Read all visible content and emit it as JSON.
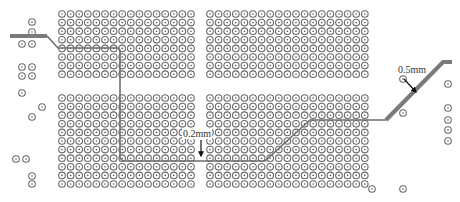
{
  "diagram": {
    "title": "",
    "colors": {
      "via_ring": "#6b6b6b",
      "via_dot": "#555555",
      "thick_trace": "#7a7a7a",
      "thin_trace": "#6e6e6e",
      "arrow": "#111111",
      "background": "#ffffff"
    },
    "via_grid": {
      "pitch": 8.6,
      "radius": 3.3,
      "blocks": [
        {
          "name": "left-upper",
          "x0": 62,
          "x1": 195,
          "y0": 14,
          "y1": 78
        },
        {
          "name": "right-upper",
          "x0": 210,
          "x1": 365,
          "y0": 14,
          "y1": 78
        },
        {
          "name": "left-lower",
          "x0": 62,
          "x1": 195,
          "y0": 98,
          "y1": 188
        },
        {
          "name": "right-lower",
          "x0": 210,
          "x1": 365,
          "y0": 98,
          "y1": 188
        }
      ],
      "extras": [
        [
          32,
          22
        ],
        [
          32,
          32
        ],
        [
          22,
          44
        ],
        [
          32,
          44
        ],
        [
          22,
          67
        ],
        [
          32,
          67
        ],
        [
          22,
          76
        ],
        [
          32,
          76
        ],
        [
          22,
          93
        ],
        [
          42,
          107
        ],
        [
          32,
          117
        ],
        [
          16,
          159
        ],
        [
          26,
          159
        ],
        [
          32,
          184
        ],
        [
          32,
          176
        ],
        [
          403,
          79
        ],
        [
          403,
          113
        ],
        [
          448,
          84
        ],
        [
          448,
          108
        ],
        [
          448,
          120
        ],
        [
          448,
          130
        ],
        [
          448,
          141
        ],
        [
          372,
          189
        ],
        [
          403,
          189
        ]
      ]
    },
    "traces": {
      "thick": {
        "width_label": "0.5mm",
        "segments": [
          [
            [
              10,
              36
            ],
            [
              47,
              36
            ]
          ],
          [
            [
              386,
              120
            ],
            [
              443,
              62
            ],
            [
              452,
              62
            ]
          ]
        ]
      },
      "thin": {
        "width_label": "0.2mm",
        "path": [
          [
            47,
            36
          ],
          [
            58,
            48
          ],
          [
            118,
            48
          ],
          [
            120,
            50
          ],
          [
            120,
            158
          ],
          [
            123,
            161
          ],
          [
            265,
            161
          ],
          [
            310,
            120
          ],
          [
            386,
            120
          ]
        ]
      }
    },
    "annotations": [
      {
        "text": "0.2mm",
        "x": 183,
        "y": 137,
        "arrow_from": [
          201,
          140
        ],
        "arrow_to": [
          201,
          156
        ]
      },
      {
        "text": "0.5mm",
        "x": 398,
        "y": 73,
        "arrow_from": [
          404,
          79
        ],
        "arrow_to": [
          416,
          92
        ]
      }
    ]
  }
}
